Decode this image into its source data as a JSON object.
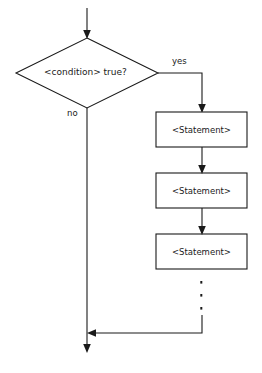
{
  "diagram": {
    "type": "flowchart",
    "decision": {
      "label": "<condition> true?",
      "shape": "diamond"
    },
    "branches": {
      "yes_label": "yes",
      "no_label": "no"
    },
    "statements": [
      {
        "label": "<Statement>"
      },
      {
        "label": "<Statement>"
      },
      {
        "label": "<Statement>"
      }
    ],
    "ellipsis": "⋮",
    "colors": {
      "stroke": "#1a1a1a",
      "fill": "#ffffff",
      "background": "#ffffff"
    }
  }
}
